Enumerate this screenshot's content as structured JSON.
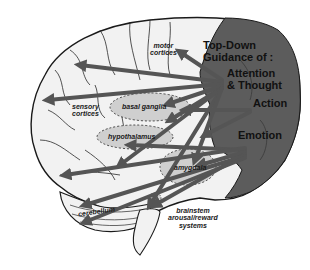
{
  "diagram": {
    "title_line1": "Top-Down",
    "title_line2": "Guidance of :",
    "functions": {
      "attention_line1": "Attention",
      "attention_line2": "& Thought",
      "action": "Action",
      "emotion": "Emotion"
    },
    "regions": {
      "motor_line1": "motor",
      "motor_line2": "cortices",
      "sensory_line1": "sensory",
      "sensory_line2": "cortices",
      "basal_ganglia": "basal ganglia",
      "hypothalamus": "hypothalamus",
      "amygdala": "amygdala",
      "cerebellum": "cerebellum",
      "brainstem_line1": "brainstem",
      "brainstem_line2": "arousal/reward",
      "brainstem_line3": "systems"
    },
    "colors": {
      "prefrontal_fill": "#5c5c5c",
      "brain_fill": "#f2f2f2",
      "arrow": "#555555",
      "nucleus_fill": "#cfcfcf",
      "outline": "#1a1a1a"
    }
  }
}
